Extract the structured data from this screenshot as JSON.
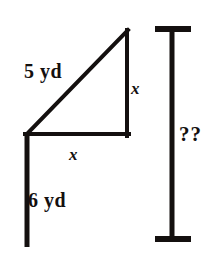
{
  "figure": {
    "background_color": "#ffffff",
    "stroke_color": "#14100f",
    "labels": {
      "hypotenuse": "5 yd",
      "pole_lower": "6 yd",
      "leg_vertical": "x",
      "leg_horizontal": "x",
      "unknown_total": "??"
    },
    "geometry": {
      "triangle": {
        "apex": [
          128,
          30
        ],
        "right_angle_corner": [
          127,
          134
        ],
        "left_corner": [
          27,
          134
        ],
        "hypotenuse_from": [
          27,
          134
        ],
        "hypotenuse_to": [
          128,
          30
        ]
      },
      "pole": {
        "top": [
          27,
          134
        ],
        "bottom": [
          27,
          247
        ],
        "stroke_width": 5
      },
      "measure_bar": {
        "x": 172,
        "top_y": 27,
        "bottom_y": 240,
        "cap_left_x": 155,
        "cap_right_x": 191,
        "cap_thickness": 6,
        "stroke_width": 5
      },
      "line_width_triangle": 4
    }
  }
}
